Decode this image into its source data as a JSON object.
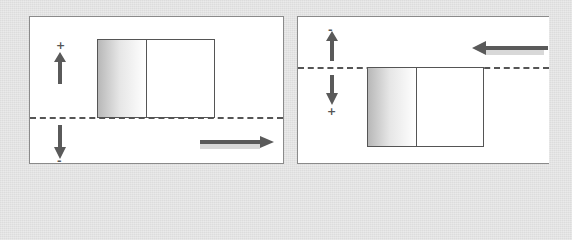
{
  "panels": [
    {
      "id": "left",
      "upper_sign": "+",
      "lower_sign": "-",
      "flow_direction": "right",
      "box_position": "above-line"
    },
    {
      "id": "right",
      "upper_sign": "-",
      "lower_sign": "+",
      "flow_direction": "left",
      "box_position": "below-line"
    }
  ],
  "icons": {
    "up_arrow": "arrow-up-icon",
    "down_arrow": "arrow-down-icon",
    "flow_right": "arrow-right-icon",
    "flow_left": "arrow-left-icon"
  },
  "colors": {
    "background": "#e3e3e3",
    "panel": "#ffffff",
    "line": "#555555",
    "arrow": "#5a5a5a"
  }
}
